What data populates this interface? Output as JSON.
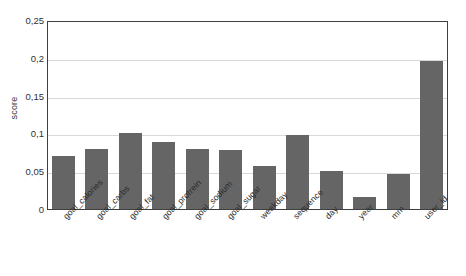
{
  "chart_data": {
    "type": "bar",
    "title": "",
    "xlabel": "",
    "ylabel": "score",
    "ylim": [
      0,
      0.25
    ],
    "grid": true,
    "legend": "none",
    "decimal_separator": ",",
    "bar_color": "#656565",
    "gridline_color": "#d9d9d9",
    "axis_color": "#3f3f3f",
    "ytick_labels": [
      "0,25",
      "0,2",
      "0,15",
      "0,1",
      "0,05",
      "0"
    ],
    "ytick_values": [
      0.25,
      0.2,
      0.15,
      0.1,
      0.05,
      0
    ],
    "categories": [
      "goal_calories",
      "goal_carbs",
      "goal_fat",
      "goal_protrein",
      "goal_sodium",
      "goal_sugar",
      "weekday",
      "sequence",
      "day",
      "year",
      "mm",
      "user_id"
    ],
    "values": [
      0.07,
      0.08,
      0.1,
      0.089,
      0.079,
      0.078,
      0.057,
      0.098,
      0.05,
      0.016,
      0.046,
      0.196
    ]
  }
}
